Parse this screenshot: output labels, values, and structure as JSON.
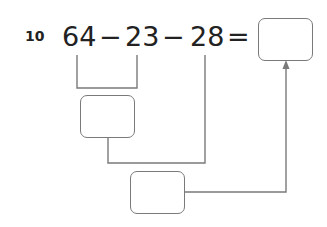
{
  "question": {
    "number": "10",
    "terms": [
      "64",
      "23",
      "28"
    ],
    "operators": [
      "−",
      "−",
      "="
    ]
  },
  "answer_boxes": [
    {
      "id": "final-result",
      "value": ""
    },
    {
      "id": "first-step",
      "value": ""
    },
    {
      "id": "second-step",
      "value": ""
    }
  ],
  "colors": {
    "text": "#222222",
    "lines": "#7a7a7a"
  }
}
